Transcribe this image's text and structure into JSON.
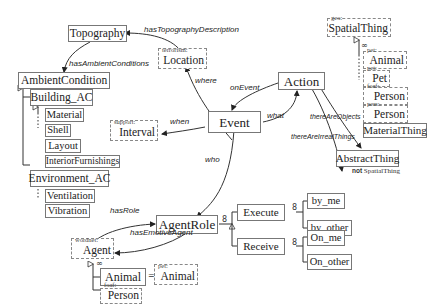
{
  "nodes": {
    "topography": "Topography",
    "ambient_condition": "AmbientCondition",
    "building_ac": "Building_AC",
    "material": "Material",
    "shell": "Shell",
    "layout": "Layout",
    "interior_furnishings": "InteriorFurnishings",
    "environment_ac": "Environment_AC",
    "ventilation": "Ventilation",
    "vibration": "Vibration",
    "location": {
      "ns": "terrorism:",
      "name": "Location"
    },
    "interval": {
      "ns": "support:",
      "name": "Interval"
    },
    "event": "Event",
    "action": "Action",
    "spatial_thing": {
      "ns": "geo:",
      "name": "SpatialThing"
    },
    "pet_animal_top": {
      "ns": "pet:",
      "name": "Animal"
    },
    "pet_pet": {
      "ns": "pet:",
      "name": "Pet"
    },
    "foaf_person_top": {
      "ns": "foaf:",
      "name": "Person"
    },
    "pers_person": {
      "ns": "pers:",
      "name": "Person"
    },
    "material_thing": "MaterialThing",
    "abstract_thing": "AbstractThing",
    "agent_role": "AgentRole",
    "execute": "Execute",
    "receive": "Receive",
    "by_me": "by_me",
    "by_other": "by_other",
    "on_me": "On_me",
    "on_other": "On_other",
    "agent": {
      "ns": "wordnet:",
      "name": "Agent"
    },
    "animal": "Animal",
    "pet_animal_bottom": {
      "ns": "pet:",
      "name": "Animal"
    },
    "foaf_person_bottom": {
      "ns": "foaf:",
      "name": "Person"
    }
  },
  "edges": {
    "has_topography_description": "hasTopographyDescription",
    "has_ambient_conditions": "hasAmbientConditions",
    "where": "where",
    "on_event": "onEvent",
    "when": "when",
    "what": "what",
    "there_are_objects": "thereAreObjects",
    "there_are_irreal_things": "thereAreIrrealThings",
    "who": "who",
    "has_role": "hasRole",
    "has_emotive_agent": "hasEmotiveAgent"
  },
  "annotations": {
    "abstract_not": "not",
    "abstract_not_target": "SpatialThing",
    "equivalence_symbol": "=",
    "infinity_symbol": "∞",
    "partition_symbol": "8"
  },
  "colors": {
    "line": "#333333",
    "border": "#777777",
    "dashed_border": "#888888"
  }
}
